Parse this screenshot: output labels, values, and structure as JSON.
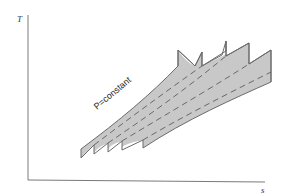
{
  "diagram": {
    "type": "T-s diagram",
    "axes": {
      "y_label": "T",
      "x_label": "s"
    },
    "annotation": "P=constant",
    "colors": {
      "axis": "#7a7a7a",
      "fill": "#c8c8c8",
      "outline": "#6a6a6a",
      "dashed": "#5e5e5e",
      "text": "#222222"
    },
    "sawtooth_count": 5,
    "dashed_line_count": 4
  }
}
